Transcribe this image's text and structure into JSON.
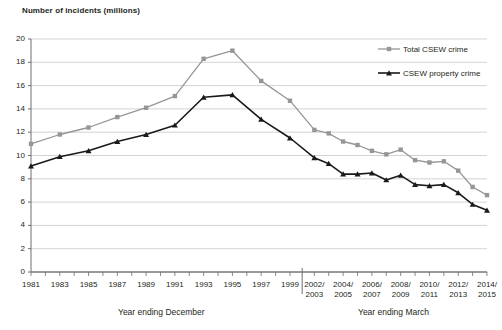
{
  "chart_data": {
    "type": "line",
    "title": "",
    "ylabel": "Number of incidents (millions)",
    "xlabel_left": "Year ending December",
    "xlabel_right": "Year ending March",
    "ylim": [
      0,
      20
    ],
    "ytick_step": 2,
    "yticks": [
      "0",
      "2",
      "4",
      "6",
      "8",
      "10",
      "12",
      "14",
      "16",
      "18",
      "20"
    ],
    "grid": true,
    "legend_position": "upper right",
    "colors": {
      "total": "#969696",
      "property": "#1a1a1a",
      "grid": "#c8c8c8",
      "axis": "#6e6e6e"
    },
    "x_period_break_after": "1999",
    "categories": [
      "1981",
      "1982",
      "1983",
      "1984",
      "1985",
      "1986",
      "1987",
      "1988",
      "1989",
      "1990",
      "1991",
      "1992",
      "1993",
      "1994",
      "1995",
      "1996",
      "1997",
      "1998",
      "1999",
      "2002/\n2003",
      "2003/\n2004",
      "2004/\n2005",
      "2005/\n2006",
      "2006/\n2007",
      "2007/\n2008",
      "2008/\n2009",
      "2009/\n2010",
      "2010/\n2011",
      "2011/\n2012",
      "2012/\n2013",
      "2013/\n2014",
      "2014/\n2015"
    ],
    "xtick_labels_december": [
      "1981",
      "1983",
      "1985",
      "1987",
      "1989",
      "1991",
      "1993",
      "1995",
      "1997",
      "1999"
    ],
    "xtick_labels_march": [
      "2002/ 2003",
      "2004/ 2005",
      "2006/ 2007",
      "2008/ 2009",
      "2010/ 2011",
      "2012/ 2013",
      "2014/ 2015"
    ],
    "series": [
      {
        "name": "Total CSEW crime",
        "marker": "square",
        "values": [
          11.0,
          null,
          11.8,
          null,
          12.4,
          null,
          13.3,
          null,
          14.1,
          null,
          15.1,
          null,
          18.3,
          null,
          19.0,
          null,
          16.4,
          null,
          14.7,
          12.2,
          11.9,
          11.2,
          10.9,
          10.4,
          10.1,
          10.5,
          9.6,
          9.4,
          9.5,
          8.7,
          7.3,
          6.6
        ]
      },
      {
        "name": "CSEW property crime",
        "marker": "triangle",
        "values": [
          9.1,
          null,
          9.9,
          null,
          10.4,
          null,
          11.2,
          null,
          11.8,
          null,
          12.6,
          null,
          15.0,
          null,
          15.2,
          null,
          13.1,
          null,
          11.5,
          9.8,
          9.3,
          8.4,
          8.4,
          8.5,
          7.9,
          8.3,
          7.5,
          7.4,
          7.5,
          6.8,
          5.8,
          5.3
        ]
      }
    ],
    "legend": [
      {
        "label": "Total CSEW crime",
        "marker": "square",
        "color": "#969696"
      },
      {
        "label": "CSEW property crime",
        "marker": "triangle",
        "color": "#1a1a1a"
      }
    ]
  }
}
